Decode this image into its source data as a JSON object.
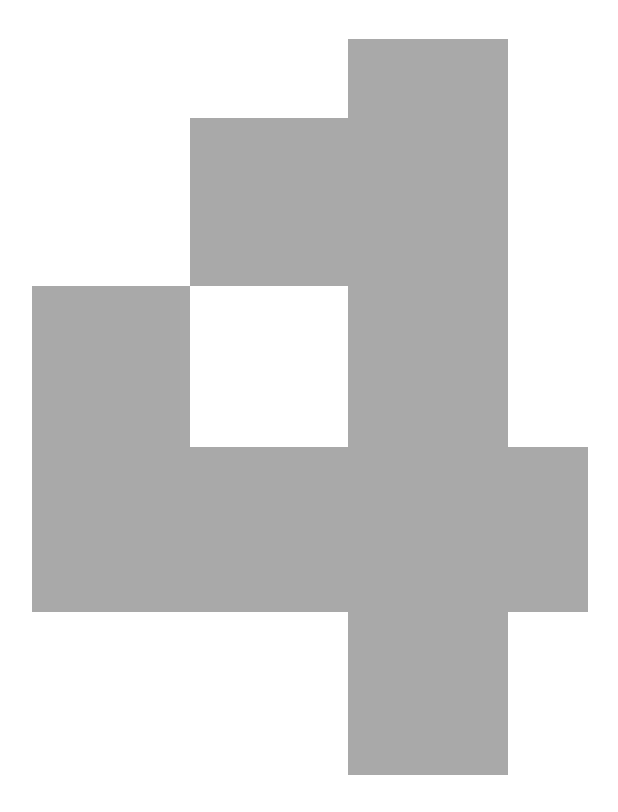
{
  "page": {
    "width": 618,
    "height": 812,
    "background_color": "#ffffff"
  },
  "figure": {
    "name": "interlocking-blocks-figure",
    "fill_color": "#a9a9a9",
    "hole_color": "#ffffff",
    "stroke": "none",
    "blocks": [
      {
        "name": "vertical-center-bar",
        "x": 348,
        "y": 39,
        "width": 160,
        "height": 736,
        "fill": "#a9a9a9"
      },
      {
        "name": "upper-middle-block",
        "x": 190,
        "y": 118,
        "width": 158,
        "height": 168,
        "fill": "#a9a9a9"
      },
      {
        "name": "left-lower-block",
        "x": 32,
        "y": 286,
        "width": 316,
        "height": 326,
        "fill": "#a9a9a9"
      },
      {
        "name": "right-side-block",
        "x": 508,
        "y": 447,
        "width": 80,
        "height": 165,
        "fill": "#a9a9a9"
      }
    ],
    "cutouts": [
      {
        "name": "center-square-hole",
        "x": 190,
        "y": 286,
        "width": 158,
        "height": 161,
        "fill": "#ffffff"
      }
    ],
    "bounds": {
      "left": 32,
      "top": 39,
      "right": 588,
      "bottom": 775
    }
  }
}
